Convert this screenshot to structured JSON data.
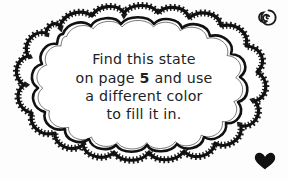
{
  "canvas": {
    "width": 288,
    "height": 179,
    "background_color": "#fdfdfd",
    "ink_color": "#111111",
    "text_color": "#222222"
  },
  "callout": {
    "shape_name": "cloud-bubble",
    "style": "hand-drawn doodle cloud with double scalloped outline and ladder hatching",
    "fill_color": "#ffffff",
    "outline_color": "#111111",
    "lines": [
      {
        "id": "line1",
        "text": "Find this state"
      },
      {
        "id": "line2",
        "pre": "on page ",
        "emphasis": "5",
        "post": " and use"
      },
      {
        "id": "line3",
        "text": "a different color"
      },
      {
        "id": "line4",
        "text": "to fill it in."
      }
    ],
    "full_text": "Find this state on page 5 and use a different color to fill it in.",
    "page_reference": "5"
  },
  "decorations": [
    {
      "id": "spiral",
      "icon": "spiral-icon",
      "position": "top-right",
      "color": "#1a1a1a"
    },
    {
      "id": "heart",
      "icon": "heart-icon",
      "position": "bottom-right",
      "color": "#111111"
    }
  ]
}
